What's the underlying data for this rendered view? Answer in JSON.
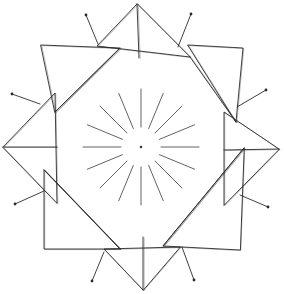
{
  "artwork": {
    "title": "Radial star line drawing",
    "description": "Hand-drawn geometric mandala: eight folded triangles arranged in a ring around a central dot with sixteen radial spokes and eight outer antennae ending in dots",
    "colors": {
      "background": "#ffffff",
      "ink": "#2a2a2a"
    },
    "center": [
      141,
      147
    ],
    "center_dot_radius": 1.2,
    "spokes": {
      "count": 16,
      "inner_radius": 20,
      "outer_radius": 58
    },
    "triangles": [
      {
        "name": "top",
        "points": [
          [
            137,
            4
          ],
          [
            97,
            46
          ],
          [
            190,
            57
          ]
        ],
        "fold": [
          [
            137,
            4
          ],
          [
            139,
            58
          ]
        ]
      },
      {
        "name": "top-right",
        "points": [
          [
            188,
            45
          ],
          [
            243,
            48
          ],
          [
            236,
            122
          ]
        ],
        "fold": [
          [
            190,
            57
          ],
          [
            236,
            122
          ]
        ]
      },
      {
        "name": "right",
        "points": [
          [
            279,
            149
          ],
          [
            224,
            112
          ],
          [
            224,
            205
          ]
        ],
        "fold": [
          [
            279,
            149
          ],
          [
            224,
            150
          ]
        ]
      },
      {
        "name": "bottom-right",
        "points": [
          [
            244,
            148
          ],
          [
            163,
            246
          ],
          [
            240,
            250
          ]
        ],
        "fold": [
          [
            244,
            148
          ],
          [
            163,
            246
          ]
        ]
      },
      {
        "name": "bottom",
        "points": [
          [
            143,
            290
          ],
          [
            104,
            249
          ],
          [
            180,
            247
          ]
        ],
        "fold": [
          [
            143,
            290
          ],
          [
            143,
            237
          ]
        ]
      },
      {
        "name": "bottom-left",
        "points": [
          [
            44,
            170
          ],
          [
            44,
            249
          ],
          [
            120,
            249
          ]
        ],
        "fold": [
          [
            44,
            170
          ],
          [
            120,
            249
          ]
        ]
      },
      {
        "name": "left",
        "points": [
          [
            3,
            147
          ],
          [
            55,
            93
          ],
          [
            57,
            203
          ]
        ],
        "fold": [
          [
            3,
            147
          ],
          [
            57,
            147
          ]
        ]
      },
      {
        "name": "top-left",
        "points": [
          [
            41,
            45
          ],
          [
            120,
            48
          ],
          [
            55,
            112
          ]
        ],
        "fold": [
          [
            120,
            48
          ],
          [
            55,
            112
          ]
        ]
      }
    ],
    "antennae": [
      {
        "from": [
          98,
          44
        ],
        "to": [
          86,
          15
        ]
      },
      {
        "from": [
          178,
          47
        ],
        "to": [
          191,
          14
        ]
      },
      {
        "from": [
          237,
          107
        ],
        "to": [
          266,
          90
        ]
      },
      {
        "from": [
          240,
          195
        ],
        "to": [
          268,
          207
        ]
      },
      {
        "from": [
          182,
          247
        ],
        "to": [
          194,
          280
        ]
      },
      {
        "from": [
          104,
          252
        ],
        "to": [
          92,
          281
        ]
      },
      {
        "from": [
          44,
          191
        ],
        "to": [
          15,
          204
        ]
      },
      {
        "from": [
          40,
          104
        ],
        "to": [
          12,
          94
        ]
      }
    ]
  }
}
